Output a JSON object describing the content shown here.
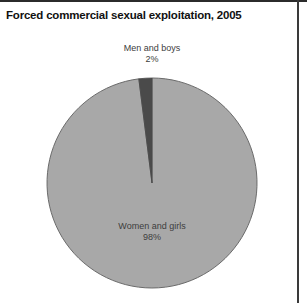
{
  "figure": {
    "title": "Forced commercial sexual exploitation, 2005",
    "width": 307,
    "height": 303,
    "background": "#ffffff",
    "border_color": "#2b2b2b"
  },
  "labels": {
    "men": {
      "name": "Men and boys",
      "percent": "2%"
    },
    "women": {
      "name": "Women and girls",
      "percent": "98%"
    }
  },
  "chart_data": {
    "type": "pie",
    "title": "Forced commercial sexual exploitation, 2005",
    "xlabel": "",
    "ylabel": "",
    "categories": [
      "Women and girls",
      "Men and boys"
    ],
    "values": [
      98,
      2
    ],
    "value_unit": "percent",
    "data_labels": [
      "98%",
      "2%"
    ],
    "colors": [
      "#a8a8a8",
      "#4a4a4a"
    ],
    "slice_outline_color": "#6b6b6b",
    "legend": "none",
    "grid": false,
    "start_angle_deg": 0,
    "direction": "clockwise",
    "geometry": {
      "center_x": 152,
      "center_y": 183,
      "radius": 105
    },
    "annotations": [
      {
        "text": "Men and boys",
        "target": "Men and boys",
        "position": "outside-top"
      },
      {
        "text": "2%",
        "target": "Men and boys",
        "position": "outside-top"
      },
      {
        "text": "Women and girls",
        "target": "Women and girls",
        "position": "inside"
      },
      {
        "text": "98%",
        "target": "Women and girls",
        "position": "inside"
      }
    ]
  }
}
